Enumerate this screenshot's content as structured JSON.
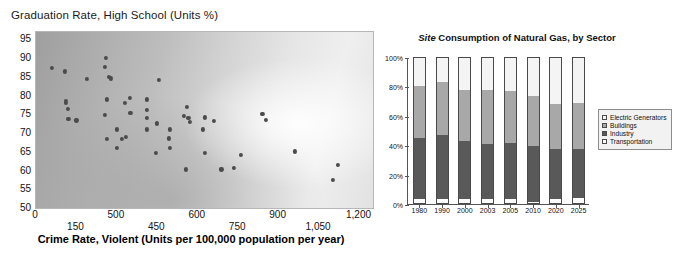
{
  "scatter": {
    "title": "Graduation Rate, High School (Units %)",
    "xtitle": "Crime Rate, Violent (Units per 100,000 population per year)"
  },
  "gas": {
    "title_italic": "Site",
    "title_rest": " Consumption of Natural Gas, by Sector"
  },
  "chart_data": [
    {
      "type": "scatter",
      "title": "Graduation Rate, High School (Units %)",
      "xlabel": "Crime Rate, Violent (Units per 100,000 population per year)",
      "ylabel": "Graduation Rate, High School (Units %)",
      "xlim": [
        0,
        1250
      ],
      "ylim": [
        50,
        97
      ],
      "grid": false,
      "legend": "none",
      "xticks": [
        {
          "value": 0,
          "label": "0",
          "row": "hi"
        },
        {
          "value": 150,
          "label": "150",
          "row": "lo"
        },
        {
          "value": 300,
          "label": "500",
          "row": "hi"
        },
        {
          "value": 450,
          "label": "450",
          "row": "lo"
        },
        {
          "value": 600,
          "label": "600",
          "row": "hi"
        },
        {
          "value": 750,
          "label": "750",
          "row": "lo"
        },
        {
          "value": 900,
          "label": "900",
          "row": "hi"
        },
        {
          "value": 1050,
          "label": "1,050",
          "row": "lo"
        },
        {
          "value": 1200,
          "label": "1,200",
          "row": "hi"
        }
      ],
      "yticks": [
        95,
        90,
        85,
        80,
        75,
        70,
        65,
        60,
        55,
        50
      ],
      "points": [
        [
          60,
          87.5
        ],
        [
          108,
          86.5
        ],
        [
          110,
          78.6
        ],
        [
          112,
          78.0
        ],
        [
          118,
          76.5
        ],
        [
          120,
          73.9
        ],
        [
          150,
          73.4
        ],
        [
          190,
          84.4
        ],
        [
          255,
          87.7
        ],
        [
          258,
          90.1
        ],
        [
          262,
          79.0
        ],
        [
          255,
          74.8
        ],
        [
          270,
          85.0
        ],
        [
          278,
          84.6
        ],
        [
          262,
          68.4
        ],
        [
          300,
          71.0
        ],
        [
          300,
          66.0
        ],
        [
          348,
          79.5
        ],
        [
          330,
          78.0
        ],
        [
          350,
          75.4
        ],
        [
          333,
          68.9
        ],
        [
          318,
          68.5
        ],
        [
          412,
          79.0
        ],
        [
          412,
          76.2
        ],
        [
          412,
          74.0
        ],
        [
          410,
          71.0
        ],
        [
          455,
          84.3
        ],
        [
          448,
          72.6
        ],
        [
          445,
          64.8
        ],
        [
          497,
          71.0
        ],
        [
          492,
          68.6
        ],
        [
          498,
          66.0
        ],
        [
          560,
          76.9
        ],
        [
          548,
          74.5
        ],
        [
          565,
          74.0
        ],
        [
          572,
          73.1
        ],
        [
          556,
          60.3
        ],
        [
          625,
          74.2
        ],
        [
          620,
          71.0
        ],
        [
          660,
          73.2
        ],
        [
          628,
          64.8
        ],
        [
          688,
          60.3
        ],
        [
          735,
          60.6
        ],
        [
          760,
          64.2
        ],
        [
          840,
          75.1
        ],
        [
          852,
          73.6
        ],
        [
          960,
          65.1
        ],
        [
          1120,
          61.5
        ],
        [
          1100,
          57.6
        ]
      ]
    },
    {
      "type": "bar",
      "subtype": "stacked-100",
      "title": "Site Consumption of Natural Gas, by Sector",
      "xlabel": "",
      "ylabel": "",
      "ylim": [
        0,
        100
      ],
      "yticks": [
        0,
        20,
        40,
        60,
        80,
        100
      ],
      "ytick_labels": [
        "0%",
        "20%",
        "40%",
        "60%",
        "80%",
        "100%"
      ],
      "grid": false,
      "legend": "right",
      "categories": [
        "1980",
        "1990",
        "2000",
        "2003",
        "2005",
        "2010",
        "2020",
        "2025"
      ],
      "series": [
        {
          "name": "Transportation",
          "values": [
            3.0,
            3.0,
            2.5,
            3.0,
            3.0,
            1.0,
            3.0,
            3.5
          ]
        },
        {
          "name": "Industry",
          "values": [
            42.0,
            44.0,
            40.5,
            37.5,
            38.5,
            38.0,
            34.0,
            33.5
          ]
        },
        {
          "name": "Buildings",
          "values": [
            36.0,
            36.5,
            35.0,
            37.5,
            35.5,
            35.0,
            31.0,
            32.0
          ]
        },
        {
          "name": "Electric Generators",
          "values": [
            19.0,
            16.5,
            22.0,
            22.0,
            23.0,
            26.0,
            32.0,
            31.0
          ]
        }
      ],
      "legend_order": [
        "Electric Generators",
        "Buildings",
        "Industry",
        "Transportation"
      ]
    }
  ]
}
